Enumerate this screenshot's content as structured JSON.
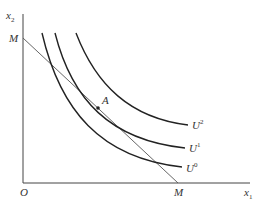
{
  "diagram": {
    "type": "indifference-curves-budget-line",
    "axes": {
      "x_label": "x",
      "x_sub": "1",
      "y_label": "x",
      "y_sub": "2",
      "origin": "O"
    },
    "budget_line": {
      "y_intercept_label": "M",
      "x_intercept_label": "M"
    },
    "curves": [
      {
        "label": "U",
        "sup": "0"
      },
      {
        "label": "U",
        "sup": "1"
      },
      {
        "label": "U",
        "sup": "2"
      }
    ],
    "point": {
      "label": "A"
    },
    "colors": {
      "line": "#222222",
      "budget": "#555555",
      "background": "#ffffff"
    }
  }
}
